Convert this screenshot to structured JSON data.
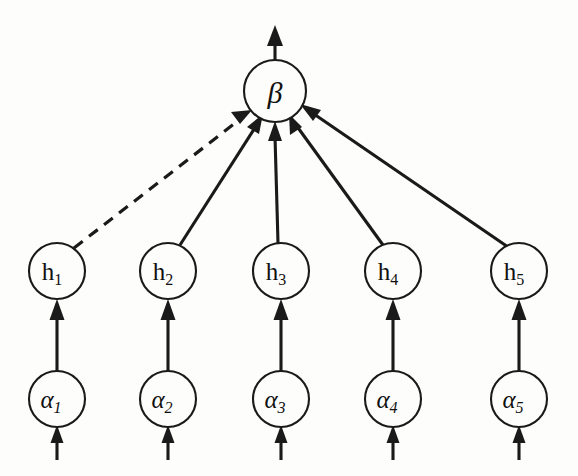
{
  "figure": {
    "kind": "node-graph-diagram",
    "background_color": "#fdfdfb",
    "ink_color": "#1a1a1a",
    "width": 578,
    "height": 476
  },
  "output_node": {
    "id": "beta",
    "label_base": "β",
    "label_sub": "",
    "cx": 275,
    "cy": 91,
    "r": 31
  },
  "hidden_layer": {
    "name": "h-layer",
    "r": 28,
    "cy": 271,
    "nodes": [
      {
        "id": "h1",
        "label_base": "h",
        "label_sub": "1",
        "cx": 57
      },
      {
        "id": "h2",
        "label_base": "h",
        "label_sub": "2",
        "cx": 168
      },
      {
        "id": "h3",
        "label_base": "h",
        "label_sub": "3",
        "cx": 281
      },
      {
        "id": "h4",
        "label_base": "h",
        "label_sub": "4",
        "cx": 393
      },
      {
        "id": "h5",
        "label_base": "h",
        "label_sub": "5",
        "cx": 519
      }
    ]
  },
  "input_layer": {
    "name": "alpha-layer",
    "r": 28,
    "cy": 399,
    "nodes": [
      {
        "id": "a1",
        "label_base": "α",
        "label_sub": "1",
        "cx": 57
      },
      {
        "id": "a2",
        "label_base": "α",
        "label_sub": "2",
        "cx": 168
      },
      {
        "id": "a3",
        "label_base": "α",
        "label_sub": "3",
        "cx": 281
      },
      {
        "id": "a4",
        "label_base": "α",
        "label_sub": "4",
        "cx": 393
      },
      {
        "id": "a5",
        "label_base": "α",
        "label_sub": "5",
        "cx": 519
      }
    ]
  },
  "edges": {
    "hidden_to_output": [
      {
        "from": "h1",
        "to": "beta",
        "style": "dashed"
      },
      {
        "from": "h2",
        "to": "beta",
        "style": "solid"
      },
      {
        "from": "h3",
        "to": "beta",
        "style": "solid"
      },
      {
        "from": "h4",
        "to": "beta",
        "style": "solid"
      },
      {
        "from": "h5",
        "to": "beta",
        "style": "solid"
      }
    ],
    "input_to_hidden": [
      {
        "from": "a1",
        "to": "h1",
        "style": "solid"
      },
      {
        "from": "a2",
        "to": "h2",
        "style": "solid"
      },
      {
        "from": "a3",
        "to": "h3",
        "style": "solid"
      },
      {
        "from": "a4",
        "to": "h4",
        "style": "solid"
      },
      {
        "from": "a5",
        "to": "h5",
        "style": "solid"
      }
    ],
    "external_inputs": [
      {
        "to": "a1",
        "style": "solid"
      },
      {
        "to": "a2",
        "style": "solid"
      },
      {
        "to": "a3",
        "style": "solid"
      },
      {
        "to": "a4",
        "style": "solid"
      },
      {
        "to": "a5",
        "style": "solid"
      }
    ],
    "external_output": {
      "from": "beta",
      "style": "solid"
    }
  }
}
